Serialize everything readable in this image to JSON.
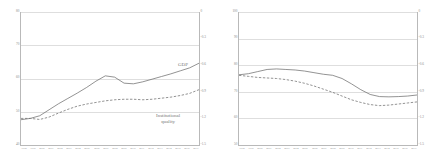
{
  "chart_data": [
    {
      "type": "line",
      "title": "EU11",
      "panel": "left",
      "xlabel": "",
      "ylabel": "",
      "grid": true,
      "legend_position": "inline-annotation",
      "x": [
        "1998",
        "1999",
        "2000",
        "2001",
        "2002",
        "2003",
        "2004",
        "2005",
        "2006",
        "2007",
        "2008",
        "2009",
        "2010",
        "2011",
        "2012",
        "2013",
        "2014",
        "2015",
        "2016",
        "2017"
      ],
      "y_left_ticks": [
        "80",
        "70",
        "60",
        "50",
        "40"
      ],
      "y_right_ticks": [
        "0",
        "-0.3",
        "-0.6",
        "-0.9",
        "-1.2",
        "-1.5"
      ],
      "ylim_left": [
        40,
        80
      ],
      "ylim_right": [
        -1.5,
        0
      ],
      "series": [
        {
          "name": "GDP",
          "style": "solid",
          "axis": "left",
          "color": "#6f6f6f",
          "values": [
            47.6,
            48.0,
            48.8,
            50.6,
            52.4,
            54.0,
            55.6,
            57.3,
            59.2,
            60.8,
            60.4,
            58.6,
            58.4,
            59.0,
            59.8,
            60.6,
            61.4,
            62.3,
            63.2,
            64.6
          ]
        },
        {
          "name": "Institutional quality",
          "style": "dashed",
          "axis": "right",
          "color": "#6f6f6f",
          "values": [
            -1.2,
            -1.2,
            -1.212,
            -1.185,
            -1.14,
            -1.098,
            -1.062,
            -1.038,
            -1.02,
            -1.002,
            -0.99,
            -0.984,
            -0.984,
            -0.99,
            -0.984,
            -0.972,
            -0.96,
            -0.942,
            -0.918,
            -0.876
          ]
        }
      ],
      "annotations": [
        {
          "text": "GDP",
          "target": "GDP"
        },
        {
          "text": "Institutional",
          "target": "Institutional quality"
        },
        {
          "text": "quality",
          "target": "Institutional quality"
        }
      ]
    },
    {
      "type": "line",
      "title": "EU-SA",
      "panel": "right",
      "xlabel": "",
      "ylabel": "",
      "grid": true,
      "legend_position": "none",
      "x": [
        "1998",
        "1999",
        "2000",
        "2001",
        "2002",
        "2003",
        "2004",
        "2005",
        "2006",
        "2007",
        "2008",
        "2009",
        "2010",
        "2011",
        "2012",
        "2013",
        "2014",
        "2015",
        "2016",
        "2017"
      ],
      "y_left_ticks": [
        "100",
        "90",
        "80",
        "70",
        "60",
        "50"
      ],
      "y_right_ticks": [
        "0",
        "-0.3",
        "-0.6",
        "-0.9",
        "-1.2",
        "-1.5"
      ],
      "ylim_left": [
        50,
        100
      ],
      "ylim_right": [
        -1.5,
        0
      ],
      "series": [
        {
          "name": "GDP",
          "style": "solid",
          "axis": "left",
          "color": "#6f6f6f",
          "values": [
            76.4,
            76.8,
            77.6,
            78.4,
            78.6,
            78.4,
            78.2,
            77.8,
            77.2,
            76.6,
            76.2,
            75.0,
            73.0,
            70.8,
            69.0,
            68.2,
            68.1,
            68.2,
            68.4,
            68.8
          ]
        },
        {
          "name": "Institutional quality",
          "style": "dashed",
          "axis": "right",
          "color": "#6f6f6f",
          "values": [
            -0.714,
            -0.726,
            -0.738,
            -0.744,
            -0.75,
            -0.762,
            -0.78,
            -0.804,
            -0.834,
            -0.87,
            -0.906,
            -0.948,
            -0.99,
            -1.02,
            -1.044,
            -1.056,
            -1.05,
            -1.038,
            -1.026,
            -1.014
          ]
        }
      ],
      "annotations": []
    }
  ]
}
